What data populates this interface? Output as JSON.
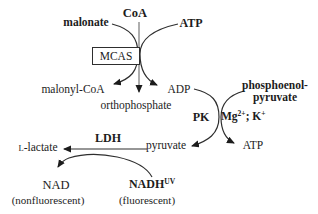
{
  "diagram": {
    "colors": {
      "background": "#ffffff",
      "text": "#1c1c1c",
      "curve": "#2e2e2e",
      "gray_line": "#8c8c8c"
    },
    "labels": {
      "coa": "CoA",
      "malonate": "malonate",
      "atp_top": "ATP",
      "mcas": "MCAS",
      "malonyl_coa": "malonyl-CoA",
      "orthophosphate": "orthophosphate",
      "adp": "ADP",
      "pep_line1": "phosphoenol-",
      "pep_line2": "pyruvate",
      "pk": "PK",
      "mg": "Mg",
      "mg_sup": "2+",
      "k": "; K",
      "k_sup": "+",
      "pyruvate": "pyruvate",
      "atp_product": "ATP",
      "ldh": "LDH",
      "lactate_prefix": "L",
      "lactate_rest": "-lactate",
      "nad": "NAD",
      "nad_note": "(nonfluorescent)",
      "nadh": "NADH",
      "nadh_sup": "UV",
      "nadh_note": "(fluorescent)"
    }
  }
}
